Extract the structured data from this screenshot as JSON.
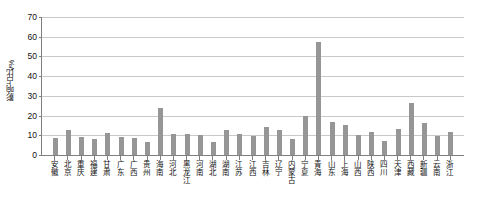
{
  "chart_data": {
    "type": "bar",
    "title": "",
    "xlabel": "",
    "ylabel": "影响占比/%",
    "ylim": [
      0,
      70
    ],
    "ytick_labels": [
      "0",
      "10",
      "20",
      "30",
      "40",
      "50",
      "60",
      "70"
    ],
    "ytick_values": [
      0,
      10,
      20,
      30,
      40,
      50,
      60,
      70
    ],
    "grid": true,
    "legend": false,
    "bar_color": "#969696",
    "categories": [
      "安徽",
      "北京",
      "重庆",
      "福建",
      "甘肃",
      "广东",
      "广西",
      "贵州",
      "海南",
      "河北",
      "黑龙江",
      "河南",
      "湖北",
      "湖南",
      "江苏",
      "江西",
      "吉林",
      "辽宁",
      "内蒙古",
      "宁夏",
      "青海",
      "山东",
      "上海",
      "山西",
      "陕西",
      "四川",
      "天津",
      "西藏",
      "新疆",
      "云南",
      "浙江"
    ],
    "values": [
      8.6,
      12.6,
      9.2,
      8.2,
      11.4,
      9.1,
      8.5,
      6.5,
      24.0,
      10.6,
      10.8,
      10.1,
      6.4,
      12.8,
      10.5,
      9.7,
      14.4,
      12.9,
      8.3,
      19.7,
      57.5,
      16.6,
      15.2,
      10.3,
      11.5,
      7.3,
      13.4,
      26.2,
      16.2,
      9.8,
      11.8
    ]
  }
}
